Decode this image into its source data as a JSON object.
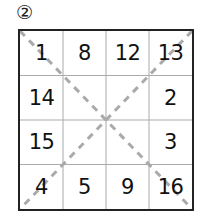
{
  "label": "②",
  "grid": {
    "rows": 4,
    "cols": 4,
    "cells": [
      [
        "1",
        "8",
        "12",
        "13"
      ],
      [
        "14",
        "",
        "",
        "2"
      ],
      [
        "15",
        "",
        "",
        "3"
      ],
      [
        "4",
        "5",
        "9",
        "16"
      ]
    ],
    "line_color": "#999999",
    "border_color": "#222222",
    "diagonal_color": "#aaaaaa",
    "diagonals": "dashed, both main diagonals"
  }
}
